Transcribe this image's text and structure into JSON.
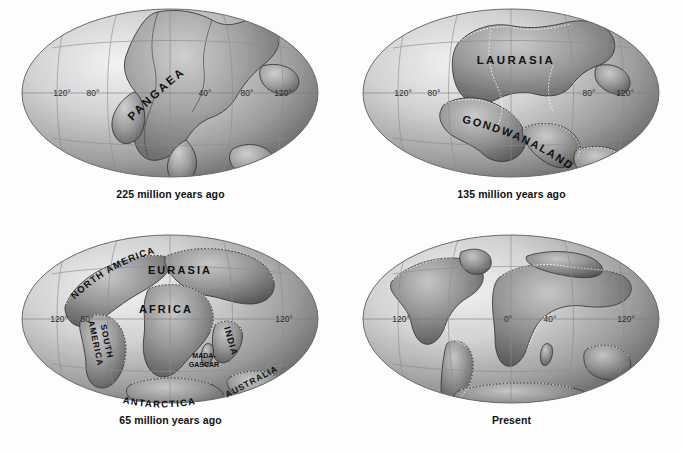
{
  "figure": {
    "background_color": "#fdfdfd",
    "projection": "mollweide-ellipse",
    "panel_layout": "2x2"
  },
  "panels": [
    {
      "id": "panel-225ma",
      "caption": "225 million years ago",
      "lon_labels": [
        "120°",
        "80°",
        "40°",
        "80°",
        "120°"
      ],
      "landmass_labels": [
        {
          "text": "PANGAEA",
          "style": "arc-up",
          "spaced": true
        }
      ]
    },
    {
      "id": "panel-135ma",
      "caption": "135 million years ago",
      "lon_labels": [
        "120°",
        "80°",
        "80°",
        "120°"
      ],
      "landmass_labels": [
        {
          "text": "LAURASIA",
          "style": "horizontal",
          "spaced": true
        },
        {
          "text": "GONDWANALAND",
          "style": "arc-down",
          "spaced": true
        }
      ]
    },
    {
      "id": "panel-65ma",
      "caption": "65 million years ago",
      "lon_labels": [
        "120°",
        "80°",
        "120°"
      ],
      "landmass_labels": [
        {
          "text": "NORTH AMERICA",
          "style": "arc-up",
          "spaced": true
        },
        {
          "text": "EURASIA",
          "style": "horizontal",
          "spaced": true
        },
        {
          "text": "AFRICA",
          "style": "horizontal",
          "spaced": true
        },
        {
          "text": "SOUTH",
          "style": "vertical",
          "spaced": true
        },
        {
          "text": "AMERICA",
          "style": "vertical",
          "spaced": true
        },
        {
          "text": "INDIA",
          "style": "vertical",
          "spaced": true
        },
        {
          "text": "MADA-",
          "style": "horizontal-small",
          "spaced": false
        },
        {
          "text": "GASCAR",
          "style": "horizontal-small",
          "spaced": false
        },
        {
          "text": "ANTARCTICA",
          "style": "arc-up-shallow",
          "spaced": true
        },
        {
          "text": "AUSTRALIA",
          "style": "rotated",
          "spaced": true
        }
      ]
    },
    {
      "id": "panel-present",
      "caption": "Present",
      "lon_labels": [
        "120°",
        "0°",
        "40°",
        "120°"
      ],
      "landmass_labels": []
    }
  ],
  "colors": {
    "ocean_light": "#e9e9e9",
    "ocean_dark": "#6f6f6f",
    "land_mid": "#9a9a9a",
    "land_dark": "#5e5e5e",
    "outline": "#3a3a3a",
    "graticule": "#8c8c8c",
    "label_text": "#111111",
    "tick_text": "#2b2b2b"
  }
}
